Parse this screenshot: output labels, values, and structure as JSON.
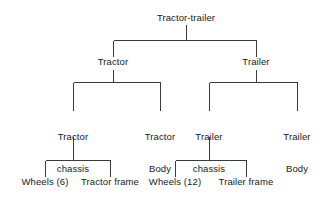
{
  "diagram": {
    "type": "tree",
    "line_color": "#3b3b3b",
    "text_color": "#1a1a1a",
    "background_color": "#ffffff",
    "levels": 4,
    "nodes": [
      {
        "id": "root",
        "label": "Tractor-trailer",
        "level": 0,
        "x": 186,
        "y": 14,
        "lines": [
          "Tractor-trailer"
        ]
      },
      {
        "id": "tractor",
        "label": "Tractor",
        "level": 1,
        "x": 113,
        "y": 58,
        "lines": [
          "Tractor"
        ]
      },
      {
        "id": "trailer",
        "label": "Trailer",
        "level": 1,
        "x": 256,
        "y": 58,
        "lines": [
          "Trailer"
        ]
      },
      {
        "id": "tractor-chassis",
        "label": "Tractor chassis",
        "level": 2,
        "x": 73,
        "y": 112,
        "lines": [
          "Tractor",
          "chassis"
        ]
      },
      {
        "id": "tractor-body",
        "label": "Tractor Body",
        "level": 2,
        "x": 160,
        "y": 112,
        "lines": [
          "Tractor",
          "Body"
        ]
      },
      {
        "id": "trailer-chassis",
        "label": "Trailer chassis",
        "level": 2,
        "x": 209,
        "y": 112,
        "lines": [
          "Trailer",
          "chassis"
        ]
      },
      {
        "id": "trailer-body",
        "label": "Trailer Body",
        "level": 2,
        "x": 297,
        "y": 112,
        "lines": [
          "Trailer",
          "Body"
        ]
      },
      {
        "id": "wheels-6",
        "label": "Wheels (6)",
        "level": 3,
        "x": 45,
        "y": 178,
        "lines": [
          "Wheels (6)"
        ]
      },
      {
        "id": "tractor-frame",
        "label": "Tractor frame",
        "level": 3,
        "x": 110,
        "y": 178,
        "lines": [
          "Tractor frame"
        ]
      },
      {
        "id": "wheels-12",
        "label": "Wheels (12)",
        "level": 3,
        "x": 175,
        "y": 178,
        "lines": [
          "Wheels (12)"
        ]
      },
      {
        "id": "trailer-frame",
        "label": "Trailer frame",
        "level": 3,
        "x": 246,
        "y": 178,
        "lines": [
          "Trailer frame"
        ]
      }
    ],
    "edges": [
      {
        "from": "root",
        "to": "tractor"
      },
      {
        "from": "root",
        "to": "trailer"
      },
      {
        "from": "tractor",
        "to": "tractor-chassis"
      },
      {
        "from": "tractor",
        "to": "tractor-body"
      },
      {
        "from": "trailer",
        "to": "trailer-chassis"
      },
      {
        "from": "trailer",
        "to": "trailer-body"
      },
      {
        "from": "tractor-chassis",
        "to": "wheels-6"
      },
      {
        "from": "tractor-chassis",
        "to": "tractor-frame"
      },
      {
        "from": "trailer-chassis",
        "to": "wheels-12"
      },
      {
        "from": "trailer-chassis",
        "to": "trailer-frame"
      }
    ]
  }
}
